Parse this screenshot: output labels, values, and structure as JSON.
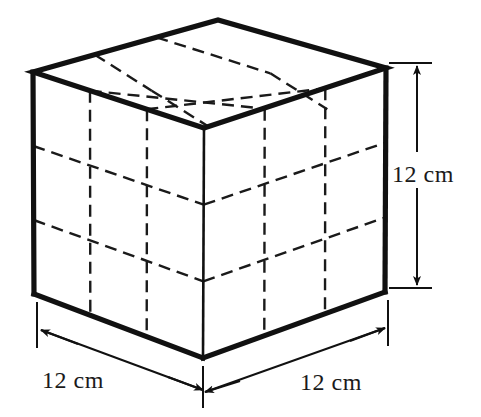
{
  "figure": {
    "kind": "3d-cube-diagram",
    "shape": "cube",
    "subdivisions": {
      "rows": 3,
      "cols": 3,
      "layers": 3
    },
    "stroke_color": "#111111",
    "grid_color": "#1a1a1a",
    "background_color": "#ffffff",
    "edge_style": "solid",
    "interior_grid_style": "dashed",
    "geometry": {
      "left_top": [
        33,
        72
      ],
      "left_bottom": [
        34,
        294
      ],
      "front_top": [
        204,
        128
      ],
      "front_bottom": [
        203,
        358
      ],
      "right_top": [
        386,
        68
      ],
      "right_bottom": [
        385,
        292
      ],
      "back_top": [
        218,
        20
      ]
    },
    "dimensions": [
      {
        "id": "height",
        "label": "12 cm",
        "value": 12,
        "unit": "cm",
        "edge": "vertical-right",
        "label_x": 392,
        "label_y": 182,
        "arrow_ends": "both"
      },
      {
        "id": "depth-left",
        "label": "12 cm",
        "value": 12,
        "unit": "cm",
        "edge": "bottom-left",
        "label_x": 42,
        "label_y": 388,
        "arrow_ends": "both"
      },
      {
        "id": "width-right",
        "label": "12 cm",
        "value": 12,
        "unit": "cm",
        "edge": "bottom-right",
        "label_x": 300,
        "label_y": 390,
        "arrow_ends": "both"
      }
    ]
  }
}
